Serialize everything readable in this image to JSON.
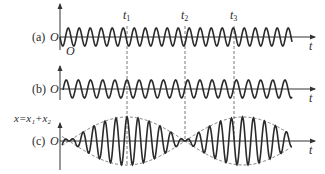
{
  "figure": {
    "panels": [
      {
        "id": "a",
        "label": "(a)",
        "origin_label": "O",
        "baseline_y": 37
      },
      {
        "id": "b",
        "label": "(b)",
        "origin_label": "O",
        "baseline_y": 89
      },
      {
        "id": "c",
        "label": "(c)",
        "origin_label": "O",
        "baseline_y": 141,
        "y_axis_label": "x=x₁+x₂"
      }
    ],
    "time_axis_label": "t",
    "origin_sub_label": "O",
    "markers": [
      {
        "label": "t",
        "sub": "1",
        "x": 127
      },
      {
        "label": "t",
        "sub": "2",
        "x": 185
      },
      {
        "label": "t",
        "sub": "3",
        "x": 234
      }
    ],
    "colors": {
      "line": "#2a2a2a",
      "axis": "#333333",
      "dashed": "#555555"
    }
  },
  "chart_data": {
    "type": "line",
    "series": [
      {
        "name": "(a) x1",
        "description": "sinusoid, constant amplitude, starts at O going downward",
        "amplitude": 9,
        "period_px": 11.2
      },
      {
        "name": "(b) x2",
        "description": "sinusoid, constant amplitude, slightly different frequency, in phase with x1 at t1 and t3",
        "amplitude": 9,
        "period_px": 10.7
      },
      {
        "name": "(c) x = x1 + x2",
        "description": "beat waveform; amplitude envelope (dashed) max at t1 and t3, near zero at t2",
        "envelope_max": 24
      }
    ],
    "xlabel": "t",
    "ylabel": "x=x₁+x₂",
    "annotations": [
      "t₁",
      "t₂",
      "t₃"
    ],
    "grid": false
  }
}
